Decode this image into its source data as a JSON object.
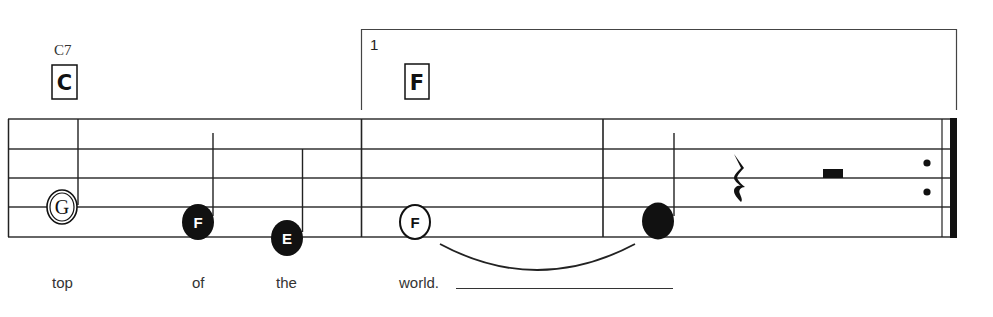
{
  "score": {
    "chords": [
      {
        "name": "C7",
        "box": "C"
      },
      {
        "name": "",
        "box": "F"
      }
    ],
    "volta": {
      "number": "1"
    },
    "notes": [
      {
        "letter": "G",
        "style": "open",
        "duration": "half"
      },
      {
        "letter": "F",
        "style": "filled",
        "duration": "quarter"
      },
      {
        "letter": "E",
        "style": "filled",
        "duration": "quarter"
      },
      {
        "letter": "F",
        "style": "open",
        "duration": "whole-tied"
      },
      {
        "letter": "",
        "style": "filled",
        "duration": "quarter"
      }
    ],
    "rests": [
      "quarter-rest",
      "half-rest"
    ],
    "ending": "repeat-end",
    "lyrics": [
      "top",
      "of",
      "the",
      "world."
    ]
  },
  "colors": {
    "ink": "#111111",
    "staff": "#333333",
    "background": "#ffffff"
  }
}
